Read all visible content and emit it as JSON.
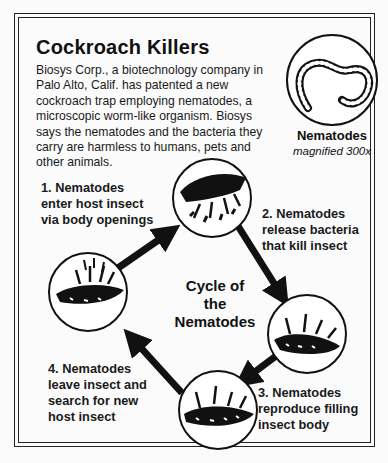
{
  "title": "Cockroach Killers",
  "intro": "Biosys Corp., a biotechnology company in Palo Alto, Calif. has patented a new cockroach trap employing nematodes, a microscopic worm-like organism.  Biosys says the nematodes and the bacteria they carry are harmless to humans, pets and other animals.",
  "illustration": {
    "label": "Nematodes",
    "caption": "magnified 300x"
  },
  "cycle": {
    "center_title": [
      "Cycle of",
      "the",
      "Nematodes"
    ],
    "steps": [
      {
        "lines": [
          "1. Nematodes",
          "enter host insect",
          "via body openings"
        ]
      },
      {
        "lines": [
          "2. Nematodes",
          "release bacteria",
          "that kill insect"
        ]
      },
      {
        "lines": [
          "3. Nematodes",
          "reproduce filling",
          "insect body"
        ]
      },
      {
        "lines": [
          "4. Nematodes",
          "leave insect and",
          "search for new",
          "host insect"
        ]
      }
    ]
  }
}
